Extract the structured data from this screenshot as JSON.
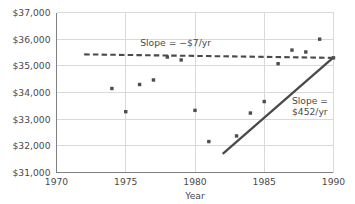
{
  "chart_data": {
    "type": "scatter",
    "title": "",
    "xlabel": "Year",
    "ylabel": "",
    "xlim": [
      1970,
      1990
    ],
    "ylim": [
      31000,
      37000
    ],
    "grid": true,
    "legend": "none",
    "x_ticks": [
      1970,
      1975,
      1980,
      1985,
      1990
    ],
    "x_tick_labels": [
      "1970",
      "1975",
      "1980",
      "1985",
      "1990"
    ],
    "y_ticks": [
      31000,
      32000,
      33000,
      34000,
      35000,
      36000,
      37000
    ],
    "y_tick_labels": [
      "$31,000",
      "$32,000",
      "$33,000",
      "$34,000",
      "$35,000",
      "$36,000",
      "$37,000"
    ],
    "points": [
      {
        "x": 1974,
        "y": 34150
      },
      {
        "x": 1975,
        "y": 33280
      },
      {
        "x": 1976,
        "y": 34300
      },
      {
        "x": 1977,
        "y": 34470
      },
      {
        "x": 1978,
        "y": 35330
      },
      {
        "x": 1979,
        "y": 35220
      },
      {
        "x": 1980,
        "y": 33330
      },
      {
        "x": 1981,
        "y": 32160
      },
      {
        "x": 1983,
        "y": 32370
      },
      {
        "x": 1984,
        "y": 33230
      },
      {
        "x": 1985,
        "y": 33660
      },
      {
        "x": 1986,
        "y": 35080
      },
      {
        "x": 1987,
        "y": 35590
      },
      {
        "x": 1988,
        "y": 35520
      },
      {
        "x": 1989,
        "y": 36000
      },
      {
        "x": 1990,
        "y": 35300
      }
    ],
    "series": [
      {
        "name": "flat-trend",
        "style": "dashed",
        "slope": -7,
        "x_start": 1972.0,
        "y_start": 35430,
        "x_end": 1990.0,
        "y_end": 35300
      },
      {
        "name": "rising-trend",
        "style": "solid",
        "slope": 452,
        "x_start": 1982.0,
        "y_start": 31700,
        "x_end": 1990.0,
        "y_end": 35320
      }
    ],
    "annotations": [
      {
        "name": "flat-slope-annotation",
        "text": "Slope = −$7/yr",
        "x": 1978.6,
        "y": 35860
      },
      {
        "name": "rising-slope-annotation",
        "line1": "Slope =",
        "line2": "$452/yr",
        "x": 1987.0,
        "y": 33700
      }
    ],
    "colors": {
      "point": "#4d4d4d",
      "trend_dashed": "#4a4a4a",
      "trend_solid": "#4a4a4a",
      "grid": "#d9d9d9",
      "axis": "#808080",
      "text": "#4a4a4a",
      "background": "#ffffff"
    }
  }
}
